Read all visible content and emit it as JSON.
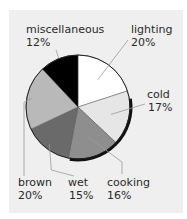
{
  "chart_data": {
    "type": "pie",
    "title": "",
    "start": "12 o'clock",
    "direction": "clockwise",
    "slices": [
      {
        "name": "lighting",
        "value": 20,
        "label": "lighting",
        "pct_label": "20%",
        "color": "#ffffff"
      },
      {
        "name": "cold",
        "value": 17,
        "label": "cold",
        "pct_label": "17%",
        "color": "#e6e6e6"
      },
      {
        "name": "cooking",
        "value": 16,
        "label": "cooking",
        "pct_label": "16%",
        "color": "#8e8e8e"
      },
      {
        "name": "wet",
        "value": 15,
        "label": "wet",
        "pct_label": "15%",
        "color": "#6a6a6a"
      },
      {
        "name": "brown",
        "value": 20,
        "label": "brown",
        "pct_label": "20%",
        "color": "#b9b9b9"
      },
      {
        "name": "miscellaneous",
        "value": 12,
        "label": "miscellaneous",
        "pct_label": "12%",
        "color": "#000000"
      }
    ],
    "colors": {
      "background": "#efefef",
      "outline": "#111111",
      "leader": "#9a9a9a",
      "text": "#2a2a2a"
    }
  }
}
